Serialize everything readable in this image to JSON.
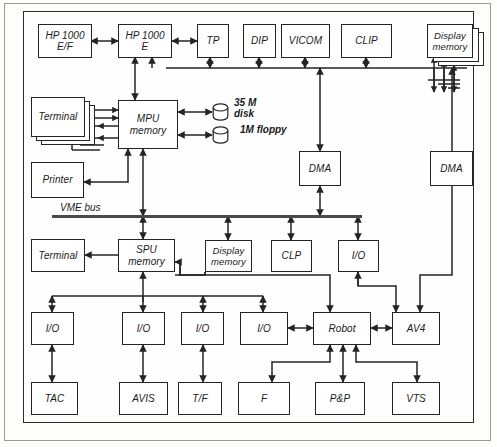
{
  "diagram": {
    "bus_labels": [
      {
        "id": "vme-bus",
        "text": "VME bus"
      }
    ],
    "annotations": [
      {
        "id": "disk-label",
        "text": "35 M\ndisk"
      },
      {
        "id": "floppy-label",
        "text": "1M floppy"
      }
    ],
    "rows": {
      "row1": [
        {
          "id": "hp1000-ef",
          "label": "HP 1000\nE/F"
        },
        {
          "id": "hp1000-e",
          "label": "HP 1000\nE"
        },
        {
          "id": "tp",
          "label": "TP"
        },
        {
          "id": "dip",
          "label": "DIP"
        },
        {
          "id": "vicom",
          "label": "VICOM"
        },
        {
          "id": "clip",
          "label": "CLIP"
        },
        {
          "id": "display-memory-top",
          "label": "Display\nmemory"
        }
      ],
      "row2": [
        {
          "id": "terminal-top",
          "label": "Terminal"
        },
        {
          "id": "mpu-memory",
          "label": "MPU\nmemory"
        },
        {
          "id": "dma-left",
          "label": "DMA"
        },
        {
          "id": "dma-right",
          "label": "DMA"
        },
        {
          "id": "printer",
          "label": "Printer"
        }
      ],
      "row3": [
        {
          "id": "terminal-spu",
          "label": "Terminal"
        },
        {
          "id": "spu-memory",
          "label": "SPU\nmemory"
        },
        {
          "id": "display-memory-spu",
          "label": "Display\nmemory"
        },
        {
          "id": "clp",
          "label": "CLP"
        },
        {
          "id": "io-spu",
          "label": "I/O"
        }
      ],
      "row4": [
        {
          "id": "io-tac",
          "label": "I/O"
        },
        {
          "id": "io-avis",
          "label": "I/O"
        },
        {
          "id": "io-tf",
          "label": "I/O"
        },
        {
          "id": "io-f",
          "label": "I/O"
        },
        {
          "id": "robot",
          "label": "Robot"
        },
        {
          "id": "av4",
          "label": "AV4"
        }
      ],
      "row5": [
        {
          "id": "tac",
          "label": "TAC"
        },
        {
          "id": "avis",
          "label": "AVIS"
        },
        {
          "id": "tf",
          "label": "T/F"
        },
        {
          "id": "f",
          "label": "F"
        },
        {
          "id": "pp",
          "label": "P&P"
        },
        {
          "id": "vts",
          "label": "VTS"
        }
      ]
    },
    "colors": {
      "line": "#242424",
      "bus": "#4a4a4a",
      "frame": "#9a9a98",
      "background": "#fdfdfc",
      "box_fill": "#ffffff"
    }
  }
}
